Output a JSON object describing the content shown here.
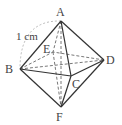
{
  "figure": {
    "type": "regular octahedron",
    "vertices": {
      "A": {
        "label": "A",
        "x": 61,
        "y": 21
      },
      "B": {
        "label": "B",
        "x": 20,
        "y": 69
      },
      "C": {
        "label": "C",
        "x": 71,
        "y": 76
      },
      "D": {
        "label": "D",
        "x": 104,
        "y": 60
      },
      "E": {
        "label": "E",
        "x": 53,
        "y": 52
      },
      "F": {
        "label": "F",
        "x": 61,
        "y": 107
      }
    },
    "edge_length_label": "1 cm",
    "solid_edges": [
      "AB",
      "AC",
      "AD",
      "BC",
      "CD",
      "BF",
      "CF",
      "DF"
    ],
    "dashed_edges": [
      "AE",
      "BE",
      "DE",
      "EF",
      "BD",
      "AF"
    ],
    "colors": {
      "line": "#333333",
      "dash": "#555555",
      "arc": "#aaaaaa",
      "text": "#444444"
    }
  }
}
